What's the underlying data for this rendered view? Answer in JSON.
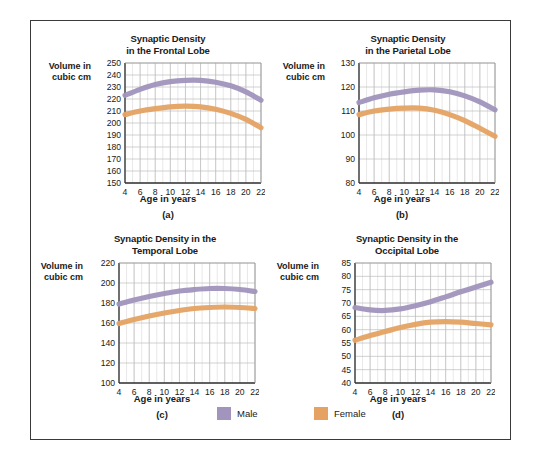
{
  "figure": {
    "y_axis_label_line1": "Volume in",
    "y_axis_label_line2": "cubic cm",
    "x_axis_label": "Age in years",
    "legend": {
      "male_label": "Male",
      "female_label": "Female",
      "male_color": "#a194bd",
      "female_color": "#e5a263"
    }
  },
  "chart_data": [
    {
      "type": "line",
      "panel": "(a)",
      "title_line1": "Synaptic Density",
      "title_line2": "in the Frontal Lobe",
      "xlabel": "Age in years",
      "ylabel": "Volume in cubic cm",
      "x": [
        4,
        6,
        8,
        10,
        12,
        14,
        16,
        18,
        20,
        22
      ],
      "xlim": [
        4,
        22
      ],
      "ylim": [
        150,
        250
      ],
      "yticks": [
        150,
        160,
        170,
        180,
        190,
        200,
        210,
        220,
        230,
        240,
        250
      ],
      "xticks": [
        4,
        6,
        8,
        10,
        12,
        14,
        16,
        18,
        20,
        22
      ],
      "grid": true,
      "series": [
        {
          "name": "Male",
          "color": "#a194bd",
          "values": [
            223,
            228,
            232,
            234.5,
            235.5,
            235.5,
            234,
            231,
            226,
            219
          ]
        },
        {
          "name": "Female",
          "color": "#e5a263",
          "values": [
            207,
            210,
            212,
            213.5,
            214,
            213.5,
            211.5,
            208,
            203,
            196
          ]
        }
      ]
    },
    {
      "type": "line",
      "panel": "(b)",
      "title_line1": "Synaptic Density",
      "title_line2": "in the Parietal Lobe",
      "xlabel": "Age in years",
      "ylabel": "Volume in cubic cm",
      "x": [
        4,
        6,
        8,
        10,
        12,
        14,
        16,
        18,
        20,
        22
      ],
      "xlim": [
        4,
        22
      ],
      "ylim": [
        80,
        130
      ],
      "yticks": [
        80,
        90,
        100,
        110,
        120,
        130
      ],
      "xticks": [
        4,
        6,
        8,
        10,
        12,
        14,
        16,
        18,
        20,
        22
      ],
      "grid": true,
      "series": [
        {
          "name": "Male",
          "color": "#a194bd",
          "values": [
            113.5,
            115.5,
            117,
            118,
            118.7,
            118.8,
            118,
            116.3,
            113.8,
            110.5
          ]
        },
        {
          "name": "Female",
          "color": "#e5a263",
          "values": [
            108.5,
            110,
            110.8,
            111.2,
            111.2,
            110.3,
            108.5,
            106,
            102.8,
            99.5
          ]
        }
      ]
    },
    {
      "type": "line",
      "panel": "(c)",
      "title_line1": "Synaptic Density in the",
      "title_line2": "Temporal Lobe",
      "xlabel": "Age in years",
      "ylabel": "Volume in cubic cm",
      "x": [
        4,
        6,
        8,
        10,
        12,
        14,
        16,
        18,
        20,
        22
      ],
      "xlim": [
        4,
        22
      ],
      "ylim": [
        100,
        220
      ],
      "yticks": [
        100,
        120,
        140,
        160,
        180,
        200,
        220
      ],
      "xticks": [
        4,
        6,
        8,
        10,
        12,
        14,
        16,
        18,
        20,
        22
      ],
      "grid": true,
      "series": [
        {
          "name": "Male",
          "color": "#a194bd",
          "values": [
            179,
            183,
            186.5,
            189.5,
            192,
            193.5,
            194.5,
            194.5,
            193.5,
            191.5
          ]
        },
        {
          "name": "Female",
          "color": "#e5a263",
          "values": [
            159.5,
            163.5,
            167,
            170,
            172.5,
            174.5,
            175.5,
            176,
            175.5,
            174.5
          ]
        }
      ]
    },
    {
      "type": "line",
      "panel": "(d)",
      "title_line1": "Synaptic Density in the",
      "title_line2": "Occipital Lobe",
      "xlabel": "Age in years",
      "ylabel": "Volume in cubic cm",
      "x": [
        4,
        6,
        8,
        10,
        12,
        14,
        16,
        18,
        20,
        22
      ],
      "xlim": [
        40,
        85
      ],
      "ylim": [
        40,
        85
      ],
      "yticks": [
        40,
        45,
        50,
        55,
        60,
        65,
        70,
        75,
        80,
        85
      ],
      "xticks": [
        4,
        6,
        8,
        10,
        12,
        14,
        16,
        18,
        20,
        22
      ],
      "grid": true,
      "series": [
        {
          "name": "Male",
          "color": "#a194bd",
          "values": [
            68.3,
            67.4,
            67.2,
            67.8,
            69.0,
            70.5,
            72.3,
            74.2,
            76.0,
            77.8
          ]
        },
        {
          "name": "Female",
          "color": "#e5a263",
          "values": [
            56.0,
            57.8,
            59.3,
            60.8,
            62.0,
            62.8,
            63.0,
            62.8,
            62.3,
            61.8
          ]
        }
      ]
    }
  ]
}
